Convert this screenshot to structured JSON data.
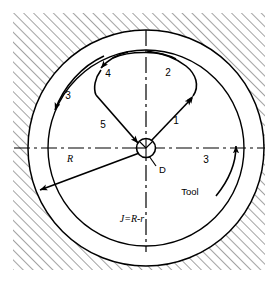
{
  "figure": {
    "type": "engineering-diagram",
    "background_color": "#ffffff",
    "line_color": "#000000",
    "hatch_color": "#555555"
  },
  "geometry": {
    "center": {
      "x": 146,
      "y": 148
    },
    "outer_circle_radius": 118,
    "inner_circle_radius": 98,
    "hub_radius": 9,
    "hatch_angle_deg": 45,
    "frame": {
      "x": 13,
      "y": 13,
      "width": 252,
      "height": 257
    }
  },
  "labels": {
    "path_1": "1",
    "path_2": "2",
    "path_3_left": "3",
    "path_3_right": "3",
    "path_4": "4",
    "path_5": "5",
    "radius": "R",
    "diameter_marker": "D",
    "tool": "Tool",
    "formula": "J=R-r"
  },
  "toolpath_segments": [
    {
      "id": "1",
      "label": "1",
      "kind": "straight",
      "direction": "outward up-right from center"
    },
    {
      "id": "2",
      "label": "2",
      "kind": "arc",
      "direction": "clockwise along inner circle toward top"
    },
    {
      "id": "3",
      "label": "3",
      "kind": "arc",
      "direction": "counter-clockwise along inner circle, left side"
    },
    {
      "id": "4",
      "label": "4",
      "kind": "arc",
      "direction": "continues around top toward left"
    },
    {
      "id": "5",
      "label": "5",
      "kind": "straight",
      "direction": "inward down-right into center"
    },
    {
      "id": "3r",
      "label": "3",
      "kind": "arc",
      "direction": "upward along outer circle, right side"
    }
  ],
  "annotations": {
    "radius_arrow": {
      "label": "R",
      "from": "center",
      "to": "lower-left outer boundary"
    },
    "center_marker": {
      "label": "D",
      "description": "tool diameter at center hub"
    },
    "material_label": "Tool",
    "clearance_formula": "J=R-r"
  }
}
